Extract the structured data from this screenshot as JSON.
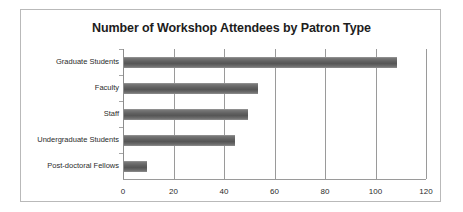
{
  "chart_data": {
    "type": "bar",
    "orientation": "horizontal",
    "title": "Number of Workshop Attendees by Patron Type",
    "xlabel": "",
    "ylabel": "",
    "categories": [
      "Graduate Students",
      "Faculty",
      "Staff",
      "Undergraduate Students",
      "Post-doctoral Fellows"
    ],
    "values": [
      108,
      53,
      49,
      44,
      9
    ],
    "xlim": [
      0,
      120
    ],
    "xticks": [
      0,
      20,
      40,
      60,
      80,
      100,
      120
    ],
    "xtick_labels": [
      "0",
      "20",
      "40",
      "60",
      "80",
      "100",
      "120"
    ],
    "grid": "vertical",
    "legend": "none",
    "bar_color": "#666666",
    "frame_border_color": "#b9b9b9",
    "gridline_color": "#9a9a9a",
    "background": "#ffffff"
  }
}
